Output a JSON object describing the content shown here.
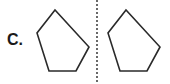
{
  "label": "C.",
  "figure": {
    "stroke_color": "#2a2a2a",
    "axis_color": "#444444",
    "left_shape": "pentagon",
    "right_shape": "pentagon",
    "divider": "dotted-vertical-line"
  }
}
